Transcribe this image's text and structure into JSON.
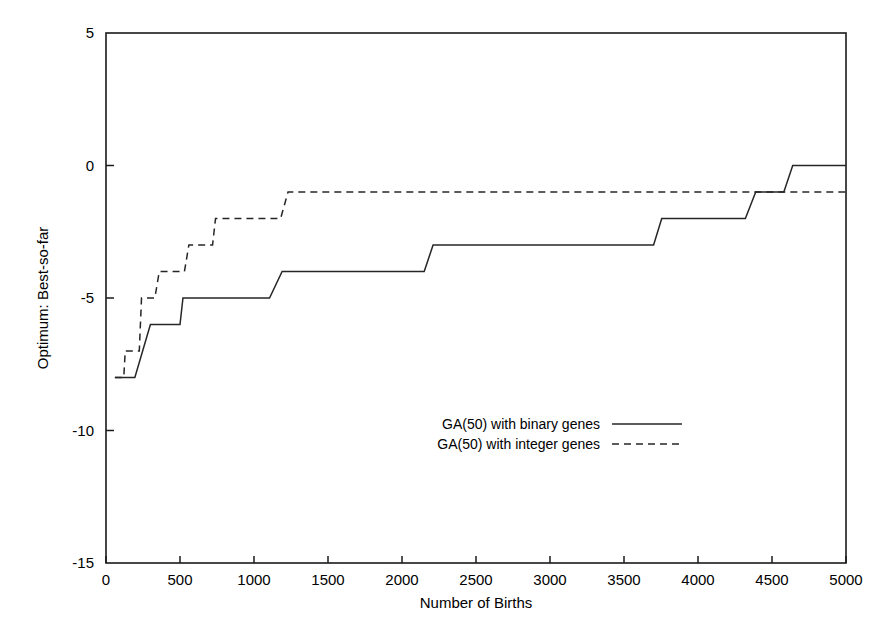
{
  "chart_data": {
    "type": "line",
    "title": "",
    "xlabel": "Number of Births",
    "ylabel": "Optimum: Best-so-far",
    "xlim": [
      0,
      5000
    ],
    "ylim": [
      -15,
      5
    ],
    "xticks": [
      0,
      500,
      1000,
      1500,
      2000,
      2500,
      3000,
      3500,
      4000,
      4500,
      5000
    ],
    "xtick_labels": [
      "0",
      "500",
      "1000",
      "1500",
      "2000",
      "2500",
      "3000",
      "3500",
      "4000",
      "4500",
      "5000"
    ],
    "yticks": [
      5,
      0,
      -5,
      -10,
      -15
    ],
    "ytick_labels": [
      "5",
      "0",
      "-5",
      "-10",
      "-15"
    ],
    "grid": false,
    "legend_position": "center",
    "series": [
      {
        "name": "GA(50) with binary genes",
        "style": "solid",
        "color": "#262626",
        "x": [
          60,
          195,
          300,
          500,
          520,
          1105,
          1190,
          2150,
          2210,
          3700,
          3755,
          4320,
          4390,
          4580,
          4640,
          5000
        ],
        "y": [
          -8,
          -8,
          -6,
          -6,
          -5,
          -5,
          -4,
          -4,
          -3,
          -3,
          -2,
          -2,
          -1,
          -1,
          0,
          0
        ]
      },
      {
        "name": "GA(50) with integer genes",
        "style": "dashed",
        "color": "#262626",
        "x": [
          60,
          120,
          130,
          225,
          240,
          330,
          360,
          530,
          560,
          720,
          740,
          1180,
          1230,
          5000
        ],
        "y": [
          -8,
          -8,
          -7,
          -7,
          -5,
          -5,
          -4,
          -4,
          -3,
          -3,
          -2,
          -2,
          -1,
          -1
        ]
      }
    ]
  },
  "legend": {
    "entries": [
      {
        "label": "GA(50) with binary genes",
        "style": "solid"
      },
      {
        "label": "GA(50) with integer genes",
        "style": "dashed"
      }
    ]
  }
}
